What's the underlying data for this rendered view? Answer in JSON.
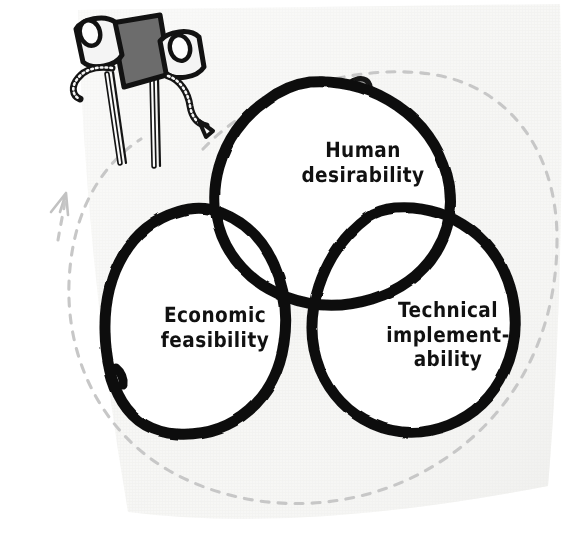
{
  "figure": {
    "kind": "hand-drawn-venn-diagram",
    "background_color": "#f6f6f4",
    "ink_color": "#0d0d0d",
    "accent_gray": "#a9a9a9",
    "dashed_guide_color": "#c9c9c9"
  },
  "venn": {
    "circles": [
      {
        "id": "human-desirability",
        "label": "Human\ndesirability",
        "position": "top"
      },
      {
        "id": "economic-feasibility",
        "label": "Economic\nfeasibility",
        "position": "bottom-left"
      },
      {
        "id": "technical-implementability",
        "label": "Technical\nimplement-\nability",
        "position": "bottom-right"
      }
    ],
    "center_overlap": {
      "name": "sweet-spot",
      "fill_color": "#a9a9a9",
      "label": ""
    }
  },
  "decorations": {
    "heart": {
      "name": "heart-icon",
      "fill_color": "#9e9e9e",
      "outline_color": "#111111"
    },
    "binoculars": {
      "name": "binoculars-icon",
      "body_color": "#6e6e6e",
      "lens_color": "#f2f2f2",
      "outline_color": "#111111"
    },
    "arrow_guide": {
      "name": "dashed-arrow-icon",
      "color": "#c6c6c6",
      "style": "dashed"
    }
  }
}
